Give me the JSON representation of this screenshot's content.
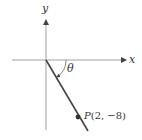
{
  "diagram": {
    "axes": {
      "x_label": "x",
      "y_label": "y"
    },
    "angle_label": "θ",
    "point": {
      "name": "P",
      "coords_text": "(2, −8)",
      "x": 2,
      "y": -8
    },
    "colors": {
      "axis": "#9a9a9a",
      "line": "#444444",
      "point": "#333333",
      "text": "#333333"
    }
  }
}
